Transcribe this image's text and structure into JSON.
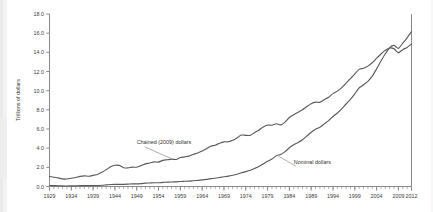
{
  "chart_data": {
    "type": "line",
    "title": "",
    "subtitle": "",
    "xlabel": "",
    "ylabel": "Trillions of dollars",
    "xlim": [
      1929,
      2012
    ],
    "ylim": [
      0.0,
      18.0
    ],
    "ytick_labels": [
      "18.0",
      "16.0",
      "14.0",
      "12.0",
      "10.0",
      "8.0",
      "6.0",
      "4.0",
      "2.0",
      "0.0"
    ],
    "ytick_values": [
      18.0,
      16.0,
      14.0,
      12.0,
      10.0,
      8.0,
      6.0,
      4.0,
      2.0,
      0.0
    ],
    "xtick_labels": [
      "1929",
      "1934",
      "1939",
      "1944",
      "1949",
      "1954",
      "1959",
      "1964",
      "1969",
      "1974",
      "1979",
      "1984",
      "1989",
      "1994",
      "1999",
      "2004",
      "2009",
      "2012"
    ],
    "xtick_values": [
      1929,
      1934,
      1939,
      1944,
      1949,
      1954,
      1959,
      1964,
      1969,
      1974,
      1979,
      1984,
      1989,
      1994,
      1999,
      2004,
      2009,
      2012
    ],
    "minor_tick_interval": 1,
    "grid": false,
    "legend_position": "inline-annotations",
    "annotations": [
      {
        "text": "Chained (2009) dollars",
        "x": 1949,
        "y": 4.4,
        "points_to_x": 1957,
        "points_to_y": 2.9
      },
      {
        "text": "Nominal dollars",
        "x": 1985,
        "y": 2.4,
        "points_to_x": 1981,
        "points_to_y": 3.3
      }
    ],
    "x": [
      1929,
      1930,
      1931,
      1932,
      1933,
      1934,
      1935,
      1936,
      1937,
      1938,
      1939,
      1940,
      1941,
      1942,
      1943,
      1944,
      1945,
      1946,
      1947,
      1948,
      1949,
      1950,
      1951,
      1952,
      1953,
      1954,
      1955,
      1956,
      1957,
      1958,
      1959,
      1960,
      1961,
      1962,
      1963,
      1964,
      1965,
      1966,
      1967,
      1968,
      1969,
      1970,
      1971,
      1972,
      1973,
      1974,
      1975,
      1976,
      1977,
      1978,
      1979,
      1980,
      1981,
      1982,
      1983,
      1984,
      1985,
      1986,
      1987,
      1988,
      1989,
      1990,
      1991,
      1992,
      1993,
      1994,
      1995,
      1996,
      1997,
      1998,
      1999,
      2000,
      2001,
      2002,
      2003,
      2004,
      2005,
      2006,
      2007,
      2008,
      2009,
      2010,
      2011,
      2012
    ],
    "series": [
      {
        "name": "Chained (2009) dollars",
        "color": "#5a5a5a",
        "values": [
          1.06,
          0.97,
          0.9,
          0.79,
          0.78,
          0.86,
          0.94,
          1.06,
          1.11,
          1.07,
          1.16,
          1.26,
          1.48,
          1.76,
          2.06,
          2.22,
          2.2,
          1.96,
          1.94,
          2.02,
          2.01,
          2.18,
          2.36,
          2.45,
          2.57,
          2.55,
          2.73,
          2.79,
          2.85,
          2.82,
          3.02,
          3.09,
          3.17,
          3.36,
          3.5,
          3.7,
          3.94,
          4.2,
          4.31,
          4.52,
          4.66,
          4.67,
          4.82,
          5.08,
          5.37,
          5.34,
          5.33,
          5.62,
          5.88,
          6.21,
          6.41,
          6.39,
          6.55,
          6.43,
          6.72,
          7.2,
          7.49,
          7.75,
          8.01,
          8.34,
          8.64,
          8.8,
          8.78,
          9.06,
          9.31,
          9.69,
          9.95,
          10.32,
          10.78,
          11.25,
          11.76,
          12.22,
          12.34,
          12.56,
          12.91,
          13.39,
          13.83,
          14.21,
          14.45,
          14.36,
          13.97,
          14.28,
          14.51,
          14.87
        ]
      },
      {
        "name": "Nominal dollars",
        "color": "#5a5a5a",
        "values": [
          0.105,
          0.092,
          0.077,
          0.059,
          0.057,
          0.066,
          0.074,
          0.085,
          0.093,
          0.087,
          0.093,
          0.103,
          0.129,
          0.166,
          0.203,
          0.224,
          0.228,
          0.228,
          0.25,
          0.275,
          0.273,
          0.3,
          0.347,
          0.367,
          0.389,
          0.391,
          0.426,
          0.45,
          0.474,
          0.482,
          0.522,
          0.543,
          0.563,
          0.605,
          0.638,
          0.685,
          0.743,
          0.815,
          0.862,
          0.943,
          1.02,
          1.076,
          1.168,
          1.282,
          1.429,
          1.549,
          1.689,
          1.878,
          2.086,
          2.357,
          2.632,
          2.863,
          3.211,
          3.345,
          3.638,
          4.041,
          4.347,
          4.59,
          4.87,
          5.253,
          5.658,
          5.98,
          6.174,
          6.539,
          6.879,
          7.309,
          7.664,
          8.1,
          8.609,
          9.089,
          9.661,
          10.285,
          10.622,
          10.978,
          11.511,
          12.275,
          13.094,
          13.856,
          14.478,
          14.719,
          14.419,
          14.964,
          15.518,
          16.163
        ]
      }
    ]
  }
}
